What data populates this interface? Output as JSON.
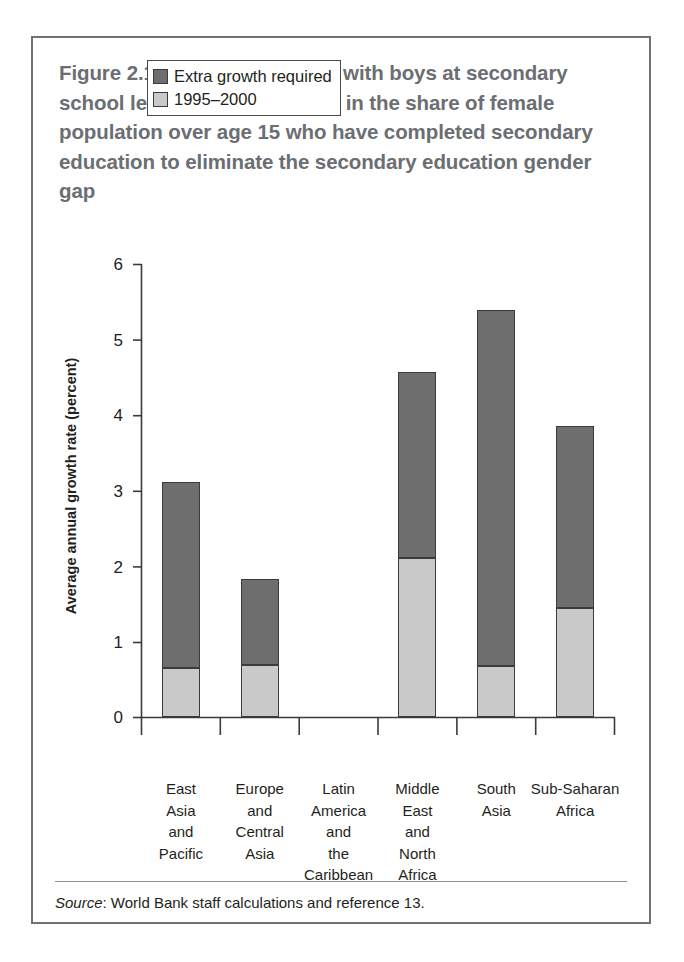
{
  "figure": {
    "source_prefix": "Source",
    "source_text": ": World Bank staff calculations and reference 13."
  },
  "legend": {
    "position": "top-left-inside-plot",
    "items": [
      {
        "label": "Extra growth required",
        "color": "#6e6e6e"
      },
      {
        "label": "1995–2000",
        "color": "#c9c9c9"
      }
    ]
  },
  "chart_data": {
    "type": "bar",
    "stacked": true,
    "xlabel": "",
    "ylabel": "Average annual growth rate (percent)",
    "ylim": [
      0,
      6
    ],
    "yticks": [
      "0",
      "1",
      "2",
      "3",
      "4",
      "5",
      "6"
    ],
    "grid": false,
    "legend_position": "upper left",
    "categories": [
      "East Asia and Pacific",
      "Europe and Central Asia",
      "Latin America and the Caribbean",
      "Middle East and North Africa",
      "South Asia",
      "Sub-Saharan Africa"
    ],
    "category_lines": [
      [
        "East",
        "Asia",
        "and",
        "Pacific"
      ],
      [
        "Europe",
        "and",
        "Central",
        "Asia"
      ],
      [
        "Latin",
        "America",
        "and",
        "the",
        "Caribbean"
      ],
      [
        "Middle",
        "East",
        "and",
        "North",
        "Africa"
      ],
      [
        "South",
        "Asia"
      ],
      [
        "Sub-Saharan",
        "Africa"
      ]
    ],
    "series": [
      {
        "name": "1995–2000",
        "color": "#c9c9c9",
        "values": [
          0.66,
          0.7,
          0,
          2.11,
          0.68,
          1.45
        ]
      },
      {
        "name": "Extra growth required",
        "color": "#6e6e6e",
        "values": [
          2.46,
          1.14,
          0,
          2.47,
          4.72,
          2.41
        ]
      }
    ],
    "totals": [
      3.12,
      1.84,
      0,
      4.58,
      5.4,
      3.86
    ]
  },
  "bars": [
    {
      "category": "East Asia and Pacific",
      "actual": 0.66,
      "total": 3.12
    },
    {
      "category": "Europe and Central Asia",
      "actual": 0.7,
      "total": 1.84
    },
    {
      "category": "Latin America and the Caribbean",
      "actual": 0,
      "total": 0
    },
    {
      "category": "Middle East and North Africa",
      "actual": 2.11,
      "total": 4.58
    },
    {
      "category": "South Asia",
      "actual": 0.68,
      "total": 5.4
    },
    {
      "category": "Sub-Saharan Africa",
      "actual": 1.45,
      "total": 3.86
    }
  ]
}
